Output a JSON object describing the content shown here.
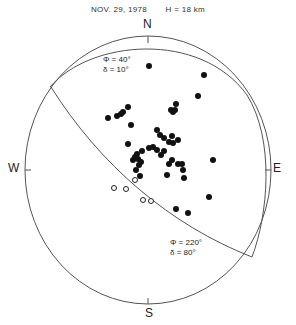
{
  "header": {
    "date": "NOV. 29, 1978",
    "depth": "H = 18 km"
  },
  "directions": {
    "north": "N",
    "south": "S",
    "west": "W",
    "east": "E"
  },
  "planes": [
    {
      "strike_label": "Φ = 40°",
      "dip_label": "δ = 10°"
    },
    {
      "strike_label": "Φ = 220°",
      "dip_label": "δ =  80°"
    }
  ],
  "chart_data": {
    "type": "scatter",
    "title": "NOV. 29, 1978   H = 18 km",
    "nodal_planes": [
      {
        "strike_deg": 40,
        "dip_deg": 10
      },
      {
        "strike_deg": 220,
        "dip_deg": 80
      }
    ],
    "compressions_px": [
      [
        149,
        66
      ],
      [
        204,
        75
      ],
      [
        198,
        96
      ],
      [
        176,
        104
      ],
      [
        171,
        110
      ],
      [
        173,
        112
      ],
      [
        175,
        110
      ],
      [
        108,
        118
      ],
      [
        117,
        116
      ],
      [
        121,
        114
      ],
      [
        123,
        112
      ],
      [
        128,
        107
      ],
      [
        131,
        125
      ],
      [
        157,
        130
      ],
      [
        160,
        135
      ],
      [
        164,
        138
      ],
      [
        172,
        136
      ],
      [
        169,
        142
      ],
      [
        173,
        143
      ],
      [
        178,
        140
      ],
      [
        128,
        144
      ],
      [
        149,
        148
      ],
      [
        153,
        147
      ],
      [
        157,
        150
      ],
      [
        164,
        151
      ],
      [
        161,
        155
      ],
      [
        142,
        151
      ],
      [
        137,
        154
      ],
      [
        135,
        157
      ],
      [
        133,
        160
      ],
      [
        138,
        159
      ],
      [
        141,
        162
      ],
      [
        139,
        165
      ],
      [
        136,
        170
      ],
      [
        140,
        176
      ],
      [
        172,
        160
      ],
      [
        169,
        164
      ],
      [
        178,
        164
      ],
      [
        182,
        164
      ],
      [
        183,
        170
      ],
      [
        184,
        178
      ],
      [
        167,
        175
      ],
      [
        213,
        160
      ],
      [
        209,
        197
      ],
      [
        176,
        209
      ],
      [
        188,
        213
      ]
    ],
    "dilatations_px": [
      [
        114,
        188
      ],
      [
        126,
        189
      ],
      [
        135,
        180
      ],
      [
        143,
        200
      ],
      [
        151,
        201
      ]
    ],
    "grid": false,
    "legend": "none"
  }
}
